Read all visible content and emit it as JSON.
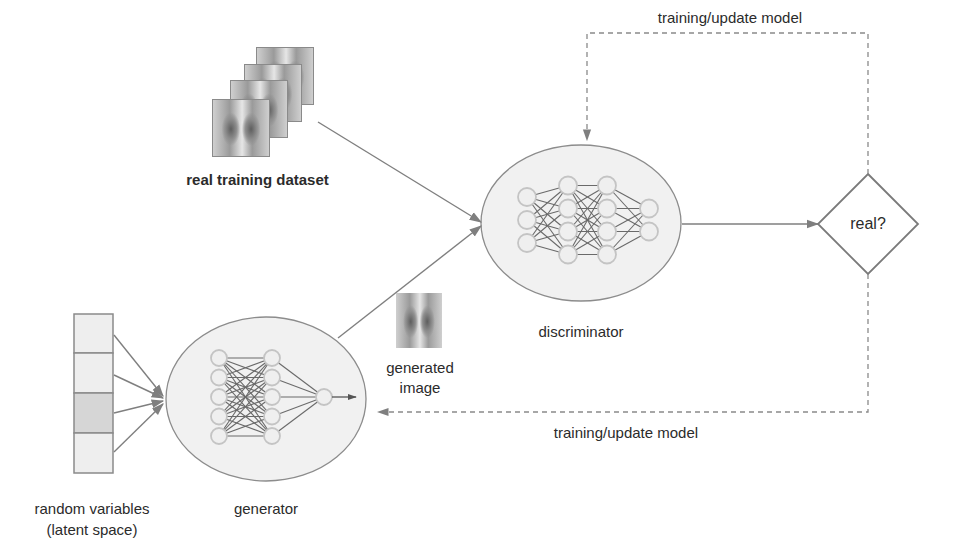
{
  "diagram": {
    "type": "GAN architecture",
    "colors": {
      "line": "#7f7f7f",
      "ellipse_fill": "#f0f0f0",
      "ellipse_stroke": "#8c8c8c",
      "neuron_fill": "#efefef",
      "neuron_stroke": "#c4c4c4",
      "latent_cell": "#eeeeee",
      "latent_cell_highlight": "#d6d6d6",
      "text": "#2b2b2b"
    },
    "nodes": {
      "real_dataset": {
        "label": "real training dataset",
        "stack_count": 4
      },
      "latent": {
        "label_line1": "random variables",
        "label_line2": "(latent space)",
        "cells": 4,
        "highlighted_cell": 3
      },
      "generator": {
        "label": "generator",
        "layers": [
          5,
          5,
          1
        ]
      },
      "generated_image": {
        "label_line1": "generated",
        "label_line2": "image"
      },
      "discriminator": {
        "label": "discriminator",
        "layers": [
          3,
          4,
          4,
          2
        ]
      },
      "decision": {
        "label": "real?"
      }
    },
    "edges": [
      {
        "from": "real_dataset",
        "to": "discriminator",
        "style": "solid"
      },
      {
        "from": "generator",
        "to": "discriminator",
        "style": "solid"
      },
      {
        "from": "latent",
        "to": "generator",
        "style": "solid"
      },
      {
        "from": "discriminator",
        "to": "decision",
        "style": "solid"
      },
      {
        "from": "decision",
        "to": "discriminator",
        "style": "dashed",
        "label": "training/update model"
      },
      {
        "from": "decision",
        "to": "generator",
        "style": "dashed",
        "label": "training/update model"
      }
    ],
    "feedback_top_label": "training/update model",
    "feedback_bottom_label": "training/update model"
  }
}
